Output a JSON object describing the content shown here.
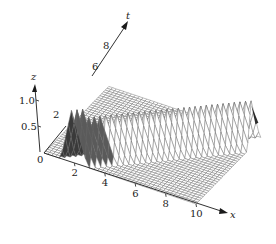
{
  "chart_data": {
    "type": "surface",
    "title": "",
    "axes": {
      "x": {
        "label": "x",
        "range": [
          0,
          10
        ],
        "ticks": [
          2,
          4,
          6,
          8,
          10
        ],
        "tick_labels": [
          "2",
          "4",
          "6",
          "8",
          "10"
        ]
      },
      "t": {
        "label": "t",
        "range": [
          0,
          9
        ],
        "ticks": [
          2,
          6,
          8
        ],
        "tick_labels": [
          "2",
          "6",
          "8"
        ]
      },
      "z": {
        "label": "z",
        "range": [
          0,
          1.2
        ],
        "ticks": [
          0.5,
          1.0
        ],
        "tick_labels": [
          "0.5",
          "1.0"
        ]
      }
    },
    "origin_label": "0",
    "surface": {
      "model": "ridge",
      "peak_height": 1.0,
      "initial_peak_x": 2,
      "speed": 1,
      "width": 0.9,
      "grid_x": 40,
      "grid_t": 36
    },
    "grid": false,
    "legend": "none"
  }
}
